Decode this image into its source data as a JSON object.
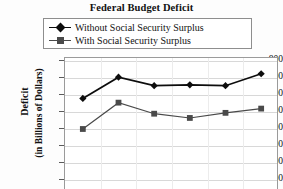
{
  "chart_data": {
    "type": "line",
    "title": "Federal Budget Deficit",
    "xlabel": "",
    "ylabel": "Deficit (in Billions of Dollars)",
    "ylabel_line1": "Deficit",
    "ylabel_line2": "(in Billions of Dollars)",
    "categories": [
      "1",
      "2",
      "3",
      "4",
      "5",
      "6"
    ],
    "yticks": [
      800,
      700,
      600,
      500,
      400,
      300,
      200,
      100
    ],
    "ylim": [
      50,
      800
    ],
    "grid": "horizontal",
    "legend_position": "top",
    "series": [
      {
        "name": "Without Social Security Surplus",
        "marker": "diamond",
        "color": "#0d0d0d",
        "values": [
          580,
          705,
          655,
          660,
          655,
          725
        ]
      },
      {
        "name": "With Social Security Surplus",
        "marker": "square",
        "color": "#4a4a4a",
        "values": [
          400,
          555,
          490,
          465,
          495,
          520
        ]
      }
    ]
  },
  "legend": {
    "items": [
      {
        "label": "Without Social Security Surplus",
        "marker": "diamond-marker-icon",
        "color": "#0d0d0d"
      },
      {
        "label": "With Social Security Surplus",
        "marker": "square-marker-icon",
        "color": "#4a4a4a"
      }
    ]
  },
  "axis": {
    "y_tick_labels": [
      "800",
      "700",
      "600",
      "500",
      "400",
      "300",
      "200",
      "100"
    ]
  },
  "colors": {
    "series1": "#0d0d0d",
    "series2": "#4a4a4a",
    "grid": "#d8d8d8",
    "frame": "#9a9a9a",
    "text": "#111111",
    "background": "#ffffff"
  }
}
